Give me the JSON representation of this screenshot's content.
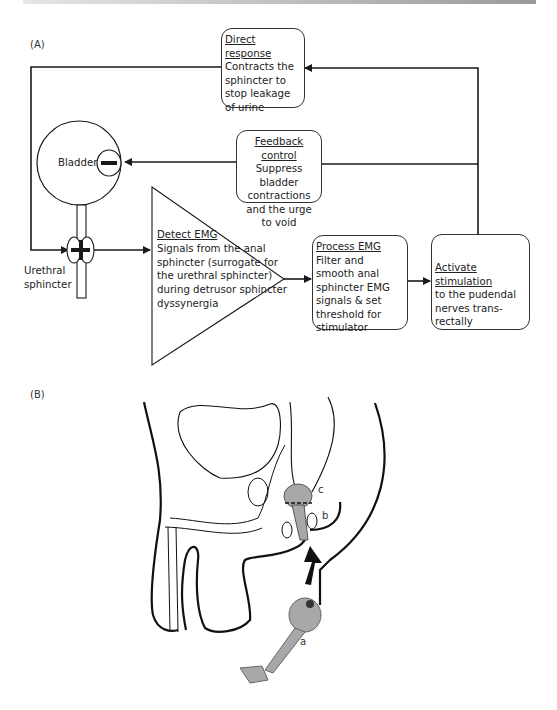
{
  "panels": {
    "a_label": "(A)",
    "b_label": "(B)"
  },
  "diagram_a": {
    "direct_response": {
      "title": "Direct response",
      "text": "Contracts the sphincter to stop leakage of urine"
    },
    "feedback_control": {
      "title": "Feedback control",
      "text": "Suppress bladder contractions and the urge to void"
    },
    "bladder": {
      "label": "Bladder",
      "sign": "−"
    },
    "urethral_sphincter": {
      "label": "Urethral sphincter",
      "sign": "+"
    },
    "detect_emg": {
      "title": "Detect EMG",
      "text": "Signals from the anal sphincter (surrogate for the urethral sphincter) during detrusor sphincter dyssynergia"
    },
    "process_emg": {
      "title": "Process EMG",
      "text": "Filter and smooth anal sphincter EMG signals & set threshold for stimulator"
    },
    "activate_stimulation": {
      "title": "Activate stimulation",
      "text": "to the pudendal nerves trans-rectally"
    }
  },
  "diagram_b": {
    "labels": {
      "a": "a",
      "b": "b",
      "c": "c"
    }
  },
  "colors": {
    "line": "#1a1a1a",
    "device": "#a8a8a8",
    "topbar_start": "#e6e6e6",
    "topbar_end": "#9a9a9a"
  }
}
